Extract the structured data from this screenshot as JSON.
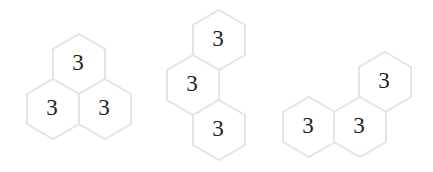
{
  "style": {
    "hex_stroke": "#e4e4e4",
    "hex_fill": "#ffffff",
    "number_color": "#1e1e1e",
    "hex_radius": 30
  },
  "pieces": [
    {
      "name": "triangle-piece",
      "cells": [
        {
          "value": "3",
          "cx": 79,
          "cy": 64
        },
        {
          "value": "3",
          "cx": 53,
          "cy": 109
        },
        {
          "value": "3",
          "cx": 105,
          "cy": 109
        }
      ]
    },
    {
      "name": "zigzag-vertical-piece",
      "cells": [
        {
          "value": "3",
          "cx": 219,
          "cy": 40
        },
        {
          "value": "3",
          "cx": 193,
          "cy": 85
        },
        {
          "value": "3",
          "cx": 219,
          "cy": 130
        }
      ]
    },
    {
      "name": "bent-line-piece",
      "cells": [
        {
          "value": "3",
          "cx": 385,
          "cy": 82
        },
        {
          "value": "3",
          "cx": 309,
          "cy": 127
        },
        {
          "value": "3",
          "cx": 360,
          "cy": 127
        }
      ]
    }
  ]
}
